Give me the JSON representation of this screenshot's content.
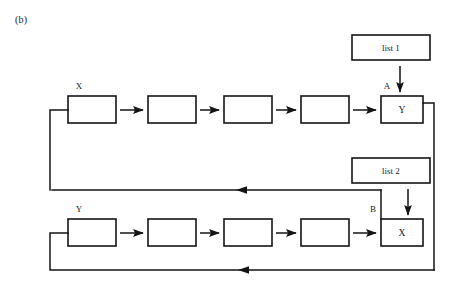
{
  "figure": {
    "panel_label": "(b)",
    "background_color": "#ffffff",
    "ink_color": "#141414"
  },
  "top_chain": {
    "head_label": "X",
    "tail_label": "Y",
    "tail_tag": "A",
    "node_count": 5,
    "nodes": [
      {
        "label": "X",
        "text": ""
      },
      {
        "label": "",
        "text": ""
      },
      {
        "label": "",
        "text": ""
      },
      {
        "label": "",
        "text": ""
      },
      {
        "label": "",
        "text": "Y"
      }
    ],
    "connector_count": 4
  },
  "bottom_chain": {
    "head_label": "Y",
    "tail_label": "X",
    "tail_tag": "B",
    "node_count": 5,
    "nodes": [
      {
        "label": "Y",
        "text": ""
      },
      {
        "label": "",
        "text": ""
      },
      {
        "label": "",
        "text": ""
      },
      {
        "label": "",
        "text": ""
      },
      {
        "label": "",
        "text": "X"
      }
    ],
    "connector_count": 4
  },
  "lists": {
    "list_one": "list 1",
    "list_two": "list 2"
  },
  "tags": {
    "tag_a": "A",
    "tag_b": "B"
  }
}
